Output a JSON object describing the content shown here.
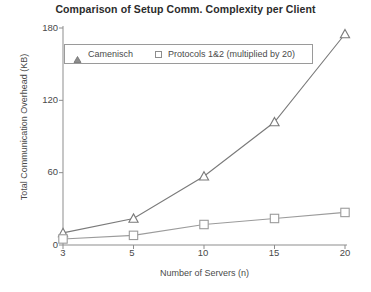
{
  "chart_data": {
    "type": "line",
    "title": "Comparison of Setup Comm. Complexity per Client",
    "xlabel": "Number of Servers (n)",
    "ylabel": "Total Communication Overhead (KB)",
    "categories": [
      "3",
      "5",
      "10",
      "15",
      "20"
    ],
    "x": [
      3,
      5,
      10,
      15,
      20
    ],
    "xticks": [
      "3",
      "5",
      "10",
      "15",
      "20"
    ],
    "yticks": [
      "0",
      "60",
      "120",
      "180"
    ],
    "ylim": [
      0,
      180
    ],
    "grid": false,
    "legend_position": "top-left-inside",
    "series": [
      {
        "name": "Camenisch",
        "marker": "triangle-open",
        "values": [
          10,
          22,
          57,
          102,
          175
        ]
      },
      {
        "name": "Protocols 1&2 (multiplied by 20)",
        "marker": "square-open",
        "values": [
          5,
          8,
          17,
          22,
          27
        ]
      }
    ]
  },
  "legend": {
    "items": [
      {
        "label": "Camenisch",
        "marker_name": "triangle-marker-icon"
      },
      {
        "label": "Protocols 1&2 (multiplied by 20)",
        "marker_name": "square-marker-icon"
      }
    ]
  },
  "colors": {
    "axis": "#8d8d8d",
    "series1": "#7a7a7a",
    "series2": "#9b9b9b",
    "text": "#4a4a4a",
    "title": "#2b2b2b",
    "background": "#ffffff"
  }
}
